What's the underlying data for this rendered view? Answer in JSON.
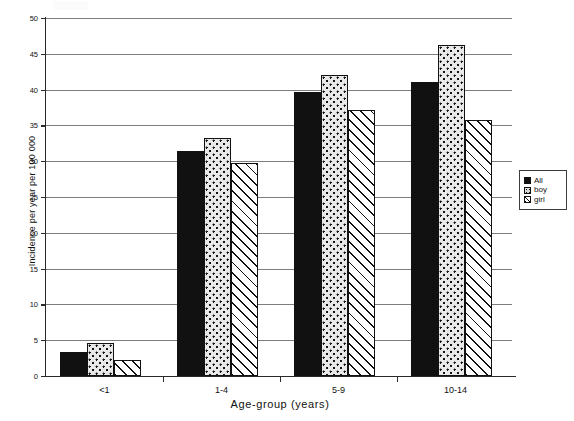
{
  "chart_data": {
    "type": "bar",
    "title": "",
    "xlabel": "Age-group (years)",
    "ylabel": "Incidence per year per 100 000",
    "categories": [
      "<1",
      "1-4",
      "5-9",
      "10-14"
    ],
    "series": [
      {
        "name": "All",
        "values": [
          3.4,
          31.4,
          39.6,
          41.0
        ]
      },
      {
        "name": "boy",
        "values": [
          4.6,
          33.3,
          42.0,
          46.2
        ]
      },
      {
        "name": "girl",
        "values": [
          2.3,
          29.7,
          37.2,
          35.7
        ]
      }
    ],
    "ylim": [
      0,
      50
    ],
    "yticks": [
      0,
      5,
      10,
      15,
      20,
      25,
      30,
      35,
      40,
      45,
      50
    ],
    "gridlines": true,
    "grid_axis": "y",
    "legend_position": "right"
  },
  "legend": {
    "entries": [
      {
        "label": "All",
        "pattern": "solid-black",
        "name": "legend-swatch-all"
      },
      {
        "label": "boy",
        "pattern": "dotted",
        "name": "legend-swatch-boy"
      },
      {
        "label": "girl",
        "pattern": "diagonal-hatch",
        "name": "legend-swatch-girl"
      }
    ]
  },
  "axes": {
    "y_title": "Incidence per year per 100 000",
    "x_title": "Age-group (years)"
  },
  "colors": {
    "series_all": "#111111",
    "series_boy": "#e9e9e9",
    "series_girl": "#ffffff",
    "grid": "#7d7d7d",
    "axis": "#2a2a2a",
    "text": "#111111"
  }
}
